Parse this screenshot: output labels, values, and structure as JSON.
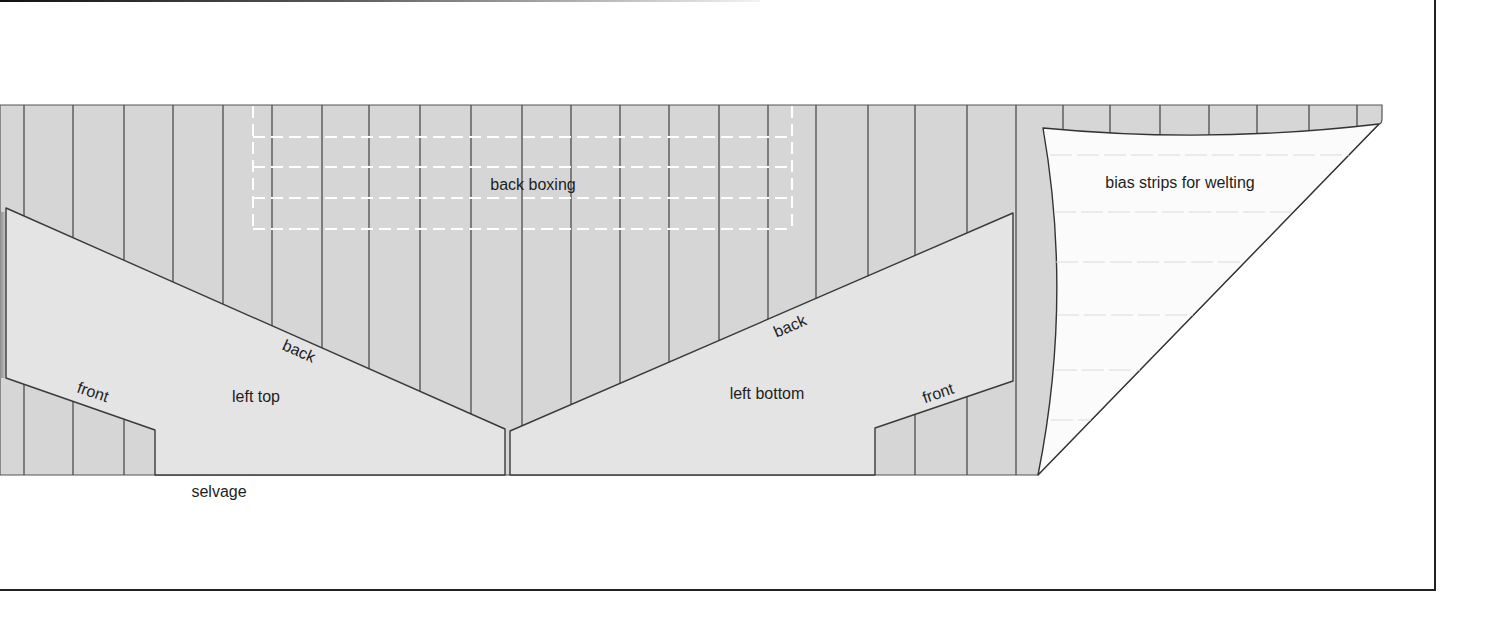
{
  "diagram": {
    "labels": {
      "back_boxing": "back boxing",
      "bias_strips": "bias strips for welting",
      "left_top": "left top",
      "left_bottom": "left bottom",
      "left_top_back_edge": "back",
      "left_top_front_edge": "front",
      "left_bottom_back_edge": "back",
      "left_bottom_front_edge": "front",
      "selvage": "selvage"
    },
    "colors": {
      "fabric": "#d6d6d6",
      "pattern_piece": "#e4e4e4",
      "bias_piece": "#fbfbfb",
      "outline": "#3a3a3a",
      "grain_line": "#4c4c4c",
      "cut_guide_dashes": "#ffffff",
      "bias_guide_lines": "#dadada",
      "frame": "#222222"
    }
  }
}
